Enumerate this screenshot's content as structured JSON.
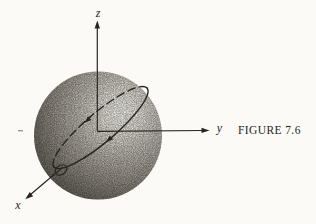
{
  "figure": {
    "caption": "FIGURE 7.6",
    "axes": {
      "x": "x",
      "y": "y",
      "z": "z"
    }
  },
  "colors": {
    "background": "#fbfaf7",
    "ink": "#27251f",
    "sphere_gradient": [
      "#f3f1eb",
      "#e2dfd7",
      "#bfbbb2",
      "#9a958c",
      "#736f66",
      "#53504a",
      "#3a3732"
    ]
  }
}
